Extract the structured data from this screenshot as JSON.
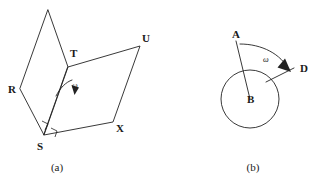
{
  "figure": {
    "background_color": "#ffffff",
    "stroke_color": "#222222",
    "panels": [
      {
        "id": "panel-a",
        "caption": "(a)",
        "caption_x": 57,
        "caption_y": 171,
        "description": "Two parallelograms hinged along a common edge, with a curved rotation arrow labeled omega",
        "labels": [
          {
            "name": "T",
            "text": "T",
            "x": 70,
            "y": 57
          },
          {
            "name": "R",
            "text": "R",
            "x": 8,
            "y": 93
          },
          {
            "name": "S",
            "text": "S",
            "x": 37,
            "y": 150
          },
          {
            "name": "U",
            "text": "U",
            "x": 142,
            "y": 42
          },
          {
            "name": "X",
            "text": "X",
            "x": 116,
            "y": 132
          },
          {
            "name": "omega",
            "text": "ω",
            "x": 72,
            "y": 88
          }
        ],
        "vertices": {
          "apex": [
            48,
            10
          ],
          "T": [
            68,
            67
          ],
          "R": [
            20,
            89
          ],
          "S": [
            44,
            135
          ],
          "U": [
            140,
            46
          ],
          "X": [
            113,
            122
          ]
        },
        "polygon_left": "48,10 68,67 44,135 20,89",
        "polygon_right": "68,67 140,46 113,122 44,135",
        "rotation_arrow": {
          "arc_path": "M 56,96 C 60,88 66,82 72,80",
          "arrow_tip": [
            75,
            94
          ],
          "arrow_head": "71.5,85 79,87.5 74.5,95"
        },
        "right_angle_marks": [
          "M 42,121 L 48,124 L 45,130",
          "M 51,128 L 57,131 L 55,137"
        ]
      },
      {
        "id": "panel-b",
        "caption": "(b)",
        "caption_x": 253,
        "caption_y": 171,
        "description": "Circle centered at B with ray BA and ray BD, curved arrow from A to D labeled omega",
        "labels": [
          {
            "name": "A",
            "text": "A",
            "x": 232,
            "y": 38
          },
          {
            "name": "B",
            "text": "B",
            "x": 247,
            "y": 103
          },
          {
            "name": "D",
            "text": "D",
            "x": 300,
            "y": 72
          },
          {
            "name": "omega",
            "text": "ω",
            "x": 263,
            "y": 62
          }
        ],
        "circle": {
          "cx": 250,
          "cy": 99,
          "r": 29
        },
        "ray_BA": {
          "x1": 250,
          "y1": 99,
          "x2": 236,
          "y2": 41
        },
        "ray_BD": {
          "x1": 266,
          "y1": 82,
          "x2": 294,
          "y2": 68
        },
        "rotation_arc": {
          "arc_path": "M 240,44 C 262,44 281,54 289,70",
          "arrow_head": "285,58.5 291,72 277.5,67.5"
        }
      }
    ]
  }
}
